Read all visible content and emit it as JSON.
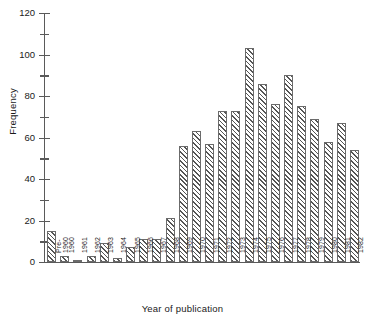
{
  "chart_data": {
    "type": "bar",
    "title": "",
    "xlabel": "Year of publication",
    "ylabel": "Frequency",
    "ylim": [
      0,
      120
    ],
    "ytick_values": [
      0,
      20,
      40,
      60,
      80,
      100,
      120
    ],
    "ytick_labels": [
      "0",
      "20",
      "40",
      "60",
      "80",
      "100",
      "120"
    ],
    "yminor_step": 10,
    "grid": false,
    "legend": null,
    "categories": [
      "Pre-\n1960",
      "1960",
      "1961",
      "1962",
      "1963",
      "1964",
      "1965",
      "1966",
      "1967",
      "1968",
      "1969",
      "1970",
      "1971",
      "1972",
      "1973",
      "1974",
      "1975",
      "1976",
      "1977",
      "1978",
      "1979",
      "1980",
      "1981",
      "1982"
    ],
    "values": [
      15,
      3,
      1,
      3,
      9,
      2,
      7,
      11,
      11,
      21,
      56,
      63,
      57,
      73,
      73,
      103,
      86,
      76,
      90,
      75,
      69,
      58,
      67,
      54
    ],
    "bar_style": {
      "fill": "diagonal-hatch",
      "edge_color": "#6b6b6b",
      "hatch_color": "#555555",
      "background": "#ffffff"
    }
  },
  "axes": {
    "y_title": "Frequency",
    "x_title": "Year of publication"
  }
}
